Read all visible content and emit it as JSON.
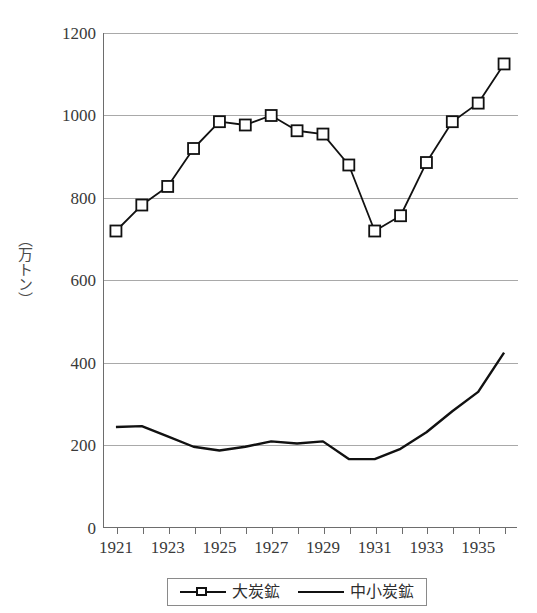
{
  "chart_data": {
    "type": "line",
    "title": "",
    "xlabel": "",
    "ylabel": "（万トン）",
    "ylim": [
      0,
      1200
    ],
    "ytick_step": 200,
    "yticks": [
      0,
      200,
      400,
      600,
      800,
      1000,
      1200
    ],
    "grid": true,
    "legend_position": "bottom",
    "x": [
      1921,
      1922,
      1923,
      1924,
      1925,
      1926,
      1927,
      1928,
      1929,
      1930,
      1931,
      1932,
      1933,
      1934,
      1935,
      1936
    ],
    "xtick_labels": [
      "1921",
      "1923",
      "1925",
      "1927",
      "1929",
      "1931",
      "1933",
      "1935"
    ],
    "xtick_values": [
      1921,
      1923,
      1925,
      1927,
      1929,
      1931,
      1933,
      1935
    ],
    "series": [
      {
        "name": "大炭鉱",
        "marker": "square",
        "values": [
          720,
          783,
          828,
          920,
          985,
          977,
          1000,
          963,
          955,
          880,
          720,
          757,
          886,
          985,
          1030,
          1125
        ]
      },
      {
        "name": "中小炭鉱",
        "marker": "none",
        "values": [
          245,
          247,
          222,
          197,
          188,
          197,
          210,
          205,
          210,
          167,
          167,
          192,
          232,
          283,
          330,
          425
        ]
      }
    ]
  },
  "axis": {
    "y_title": "（万トン）",
    "y_labels": [
      "1200",
      "1000",
      "800",
      "600",
      "400",
      "200",
      "0"
    ],
    "x_labels": [
      "1921",
      "1923",
      "1925",
      "1927",
      "1929",
      "1931",
      "1933",
      "1935"
    ]
  },
  "legend": {
    "entries": [
      {
        "label": "大炭鉱",
        "marker": "square-marker-icon"
      },
      {
        "label": "中小炭鉱",
        "marker": "line-marker-icon"
      }
    ]
  },
  "colors": {
    "series_line": "#111111",
    "marker_fill": "#ffffff",
    "gridline": "#a9a9a9",
    "axis": "#6d6d6d",
    "text": "#3a3a3a",
    "background": "#ffffff"
  }
}
